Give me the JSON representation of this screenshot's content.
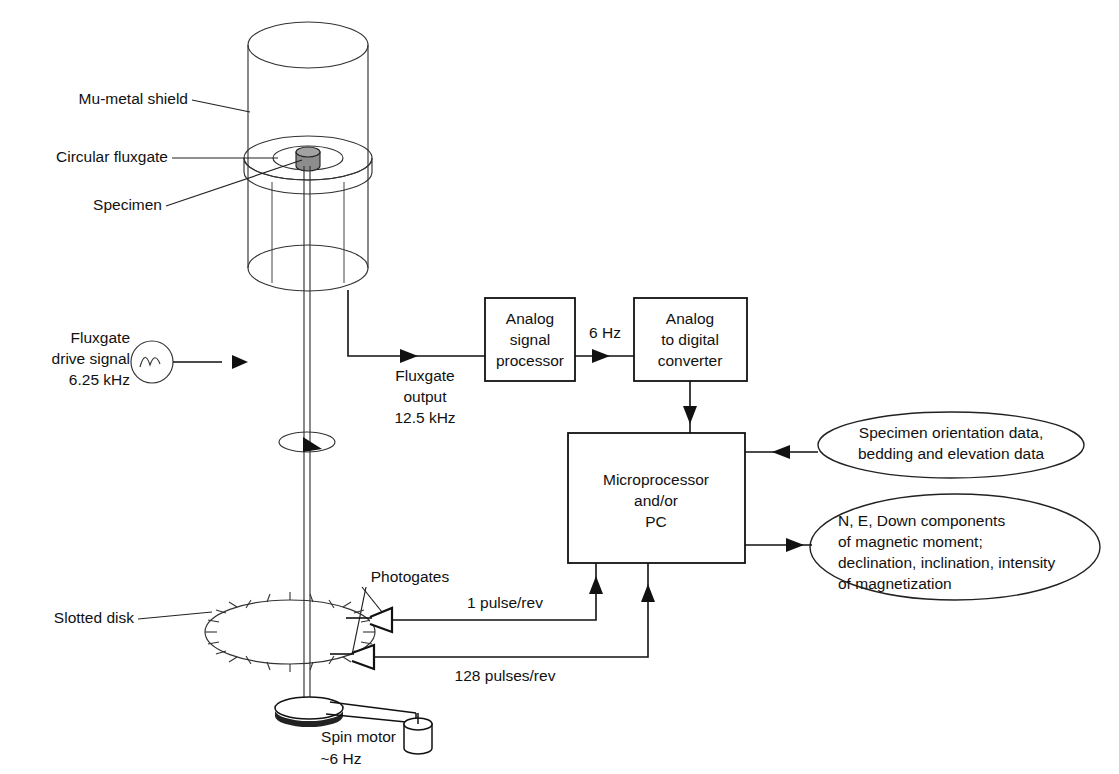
{
  "figure": {
    "background_color": "#ffffff",
    "line_color": "#111111"
  },
  "labels": {
    "mu_metal_shield": "Mu-metal shield",
    "circular_fluxgate": "Circular fluxgate",
    "specimen": "Specimen",
    "fluxgate_drive_line1": "Fluxgate",
    "fluxgate_drive_line2": "drive signal",
    "fluxgate_drive_line3": "6.25 kHz",
    "fluxgate_output_line1": "Fluxgate",
    "fluxgate_output_line2": "output",
    "fluxgate_output_line3": "12.5 kHz",
    "six_hz": "6 Hz",
    "photogates": "Photogates",
    "slotted_disk": "Slotted disk",
    "one_pulse_per_rev": "1 pulse/rev",
    "one_two_eight_pulses_per_rev": "128 pulses/rev",
    "spin_motor_line1": "Spin motor",
    "spin_motor_line2": "~6 Hz"
  },
  "boxes": {
    "analog_signal_processor": {
      "line1": "Analog",
      "line2": "signal",
      "line3": "processor"
    },
    "analog_to_digital_converter": {
      "line1": "Analog",
      "line2": "to digital",
      "line3": "converter"
    },
    "microprocessor": {
      "line1": "Microprocessor",
      "line2": "and/or",
      "line3": "PC"
    }
  },
  "ellipses": {
    "input_data": {
      "line1": "Specimen orientation data,",
      "line2": "bedding and elevation data"
    },
    "output_data": {
      "line1": "N, E, Down components",
      "line2": "of magnetic moment;",
      "line3": "declination, inclination, intensity",
      "line4": "of magnetization"
    }
  },
  "icons": {
    "signal_generator": "sine-wave-source-icon",
    "rotation_arrow": "rotation-arrow-icon",
    "photogate_upper": "photogate-bracket-icon",
    "photogate_lower": "photogate-bracket-icon",
    "spin_motor_body": "motor-cylinder-icon"
  }
}
